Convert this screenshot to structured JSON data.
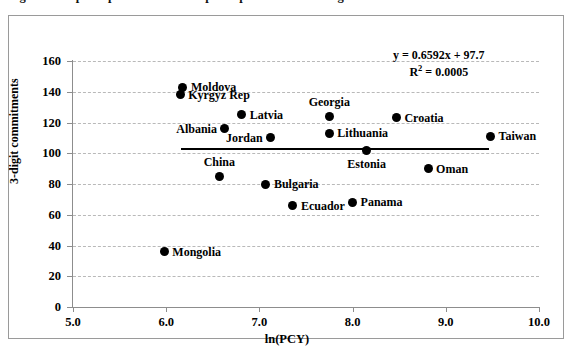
{
  "figure": {
    "caption_fragment": "Figure 3. Export specialization and per capita income among transition economies",
    "frame_border_color": "#9a9a9a"
  },
  "chart_data": {
    "type": "scatter",
    "title": "",
    "xlabel": "ln(PCY)",
    "ylabel": "3-digit commitments",
    "xlim": [
      5.0,
      10.0
    ],
    "ylim": [
      0,
      160
    ],
    "xticks": [
      "5.0",
      "6.0",
      "7.0",
      "8.0",
      "9.0",
      "10.0"
    ],
    "xtick_values": [
      5.0,
      6.0,
      7.0,
      8.0,
      9.0,
      10.0
    ],
    "yticks": [
      "0",
      "20",
      "40",
      "60",
      "80",
      "100",
      "120",
      "140",
      "160"
    ],
    "ytick_values": [
      0,
      20,
      40,
      60,
      80,
      100,
      120,
      140,
      160
    ],
    "grid": "horizontal-dashed",
    "legend": "none",
    "marker_color": "#000000",
    "points": [
      {
        "label": "Moldova",
        "x": 6.18,
        "y": 143,
        "label_pos": "right"
      },
      {
        "label": "Kyrgyz Rep",
        "x": 6.15,
        "y": 138,
        "label_pos": "right"
      },
      {
        "label": "Latvia",
        "x": 6.81,
        "y": 125,
        "label_pos": "right"
      },
      {
        "label": "Albania",
        "x": 6.63,
        "y": 116,
        "label_pos": "left"
      },
      {
        "label": "Jordan",
        "x": 7.12,
        "y": 110,
        "label_pos": "left"
      },
      {
        "label": "Georgia",
        "x": 7.75,
        "y": 124,
        "label_pos": "above"
      },
      {
        "label": "Lithuania",
        "x": 7.75,
        "y": 113,
        "label_pos": "right"
      },
      {
        "label": "Croatia",
        "x": 8.47,
        "y": 123,
        "label_pos": "right"
      },
      {
        "label": "Taiwan",
        "x": 9.48,
        "y": 111,
        "label_pos": "right"
      },
      {
        "label": "Estonia",
        "x": 8.15,
        "y": 102,
        "label_pos": "below"
      },
      {
        "label": "Oman",
        "x": 8.81,
        "y": 90,
        "label_pos": "right"
      },
      {
        "label": "China",
        "x": 6.57,
        "y": 85,
        "label_pos": "above"
      },
      {
        "label": "Bulgaria",
        "x": 7.07,
        "y": 80,
        "label_pos": "right"
      },
      {
        "label": "Ecuador",
        "x": 7.36,
        "y": 66,
        "label_pos": "right"
      },
      {
        "label": "Panama",
        "x": 8.0,
        "y": 68,
        "label_pos": "right"
      },
      {
        "label": "Mongolia",
        "x": 5.98,
        "y": 36,
        "label_pos": "right"
      }
    ],
    "trendline": {
      "slope": 0.6592,
      "intercept": 97.7,
      "x_start": 6.16,
      "x_end": 9.46,
      "color": "#000000"
    },
    "annotation": {
      "equation": "y = 0.6592x + 97.7",
      "r_squared_prefix": "R",
      "r_squared_exponent": "2",
      "r_squared_value": " = 0.0005"
    }
  }
}
